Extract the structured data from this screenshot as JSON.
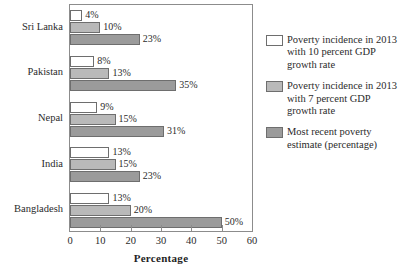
{
  "chart_data": {
    "type": "bar",
    "title": "",
    "xlabel": "Percentage",
    "ylabel": "",
    "xlim": [
      0,
      60
    ],
    "xticks": [
      0,
      10,
      20,
      30,
      40,
      50,
      60
    ],
    "xtick_labels": [
      "0",
      "10",
      "20",
      "30",
      "40",
      "50",
      "60"
    ],
    "grid": false,
    "orientation": "horizontal",
    "legend_position": "right",
    "categories": [
      "Sri Lanka",
      "Pakistan",
      "Nepal",
      "India",
      "Bangladesh"
    ],
    "series": [
      {
        "name": "Poverty incidence in 2013 with 10 percent GDP growth rate",
        "color": "#ffffff",
        "values": [
          4,
          8,
          9,
          13,
          13
        ],
        "labels": [
          "4%",
          "8%",
          "9%",
          "13%",
          "13%"
        ]
      },
      {
        "name": "Poverty incidence in 2013 with 7 percent GDP growth rate",
        "color": "#b9b9b9",
        "values": [
          10,
          13,
          15,
          15,
          20
        ],
        "labels": [
          "10%",
          "13%",
          "15%",
          "15%",
          "20%"
        ]
      },
      {
        "name": "Most recent poverty estimate (percentage)",
        "color": "#9b9b9b",
        "values": [
          23,
          35,
          31,
          23,
          50
        ],
        "labels": [
          "23%",
          "35%",
          "31%",
          "23%",
          "50%"
        ]
      }
    ]
  },
  "legend": {
    "entries": [
      {
        "label": "Poverty incidence in 2013 with 10 percent GDP growth rate",
        "swatch": "white-swatch"
      },
      {
        "label": "Poverty incidence in 2013 with 7 percent GDP growth rate",
        "swatch": "light-gray-swatch"
      },
      {
        "label": "Most recent poverty estimate (percentage)",
        "swatch": "medium-gray-swatch"
      }
    ]
  },
  "axis": {
    "x_title": "Percentage"
  }
}
